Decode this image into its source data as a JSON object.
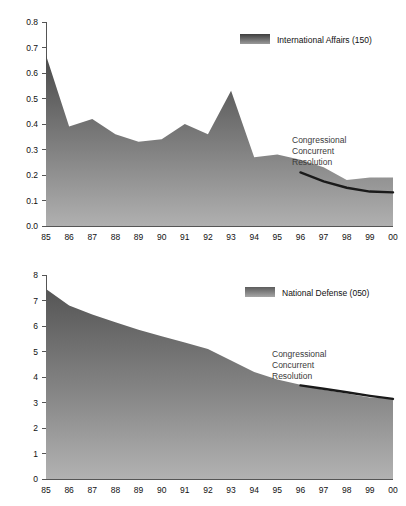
{
  "figure": {
    "name": "budget-outlays-percent-gdp",
    "background": "#ffffff",
    "fill_top_color": "#4a4a4a",
    "fill_bottom_color": "#a8a8a8",
    "accent_line_color": "#1a1a1a",
    "axis_color": "#555555",
    "partial_title": ""
  },
  "chart_data": [
    {
      "id": "international-affairs",
      "type": "area",
      "title": "",
      "subtitle": "",
      "xlabel": "",
      "ylabel": "",
      "grid": false,
      "legend_position": "top-right",
      "legend": [
        {
          "label": "International Affairs (150)",
          "swatch": "gradient-gray"
        }
      ],
      "annotations": [
        {
          "text": "Congressional",
          "line2": "Concurrent",
          "line3": "Resolution"
        }
      ],
      "annotation_lines": [
        "Congressional",
        "Concurrent",
        "Resolution"
      ],
      "ylim": [
        0.0,
        0.8
      ],
      "yticks": [
        0.0,
        0.1,
        0.2,
        0.3,
        0.4,
        0.5,
        0.6,
        0.7,
        0.8
      ],
      "ytick_labels": [
        "0.0",
        "0.1",
        "0.2",
        "0.3",
        "0.4",
        "0.5",
        "0.6",
        "0.7",
        "0.8"
      ],
      "categories": [
        "85",
        "86",
        "87",
        "88",
        "89",
        "90",
        "91",
        "92",
        "93",
        "94",
        "95",
        "96",
        "97",
        "98",
        "99",
        "00"
      ],
      "values": [
        0.67,
        0.39,
        0.42,
        0.36,
        0.33,
        0.34,
        0.4,
        0.36,
        0.53,
        0.27,
        0.28,
        0.26,
        0.23,
        0.18,
        0.19,
        0.19
      ],
      "series": [
        {
          "name": "International Affairs (150)",
          "values": [
            0.67,
            0.39,
            0.42,
            0.36,
            0.33,
            0.34,
            0.4,
            0.36,
            0.53,
            0.27,
            0.28,
            0.26,
            0.23,
            0.18,
            0.19,
            0.19
          ]
        },
        {
          "name": "Congressional Concurrent Resolution",
          "x": [
            "96",
            "97",
            "98",
            "99",
            "00"
          ],
          "values": [
            0.21,
            0.175,
            0.15,
            0.135,
            0.132
          ]
        }
      ]
    },
    {
      "id": "national-defense",
      "type": "area",
      "title": "",
      "subtitle": "",
      "xlabel": "",
      "ylabel": "",
      "grid": false,
      "legend_position": "top-right",
      "legend": [
        {
          "label": "National Defense (050)",
          "swatch": "gradient-gray"
        }
      ],
      "annotations": [
        {
          "text": "Congressional",
          "line2": "Concurrent",
          "line3": "Resolution"
        }
      ],
      "annotation_lines": [
        "Congressional",
        "Concurrent",
        "Resolution"
      ],
      "ylim": [
        0,
        8
      ],
      "yticks": [
        0,
        1,
        2,
        3,
        4,
        5,
        6,
        7,
        8
      ],
      "ytick_labels": [
        "0",
        "1",
        "2",
        "3",
        "4",
        "5",
        "6",
        "7",
        "8"
      ],
      "categories": [
        "85",
        "86",
        "87",
        "88",
        "89",
        "90",
        "91",
        "92",
        "93",
        "94",
        "95",
        "96",
        "97",
        "98",
        "99",
        "00"
      ],
      "values": [
        7.45,
        6.8,
        6.45,
        6.15,
        5.85,
        5.6,
        5.35,
        5.1,
        4.65,
        4.2,
        3.9,
        3.7,
        3.5,
        3.35,
        3.2,
        3.15
      ],
      "series": [
        {
          "name": "National Defense (050)",
          "values": [
            7.45,
            6.8,
            6.45,
            6.15,
            5.85,
            5.6,
            5.35,
            5.1,
            4.65,
            4.2,
            3.9,
            3.7,
            3.5,
            3.35,
            3.2,
            3.15
          ]
        },
        {
          "name": "Congressional Concurrent Resolution",
          "x": [
            "96",
            "97",
            "98",
            "99",
            "00"
          ],
          "values": [
            3.67,
            3.54,
            3.4,
            3.26,
            3.14
          ]
        }
      ]
    }
  ]
}
